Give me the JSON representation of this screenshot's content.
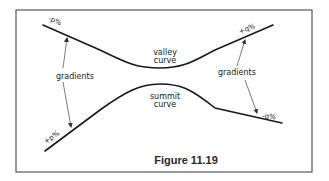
{
  "figure": {
    "caption": "Figure 11.19",
    "labels": {
      "top_left_gradient": "-p%",
      "top_right_gradient": "+q%",
      "bottom_left_gradient": "+p%",
      "bottom_right_gradient": "-q%",
      "left_gradients": "gradients",
      "right_gradients": "gradients",
      "valley_line1": "valley",
      "valley_line2": "curve",
      "summit_line1": "summit",
      "summit_line2": "curve"
    },
    "colors": {
      "line": "#1a1a1a",
      "frame": "#555555",
      "background": "#ffffff"
    }
  }
}
